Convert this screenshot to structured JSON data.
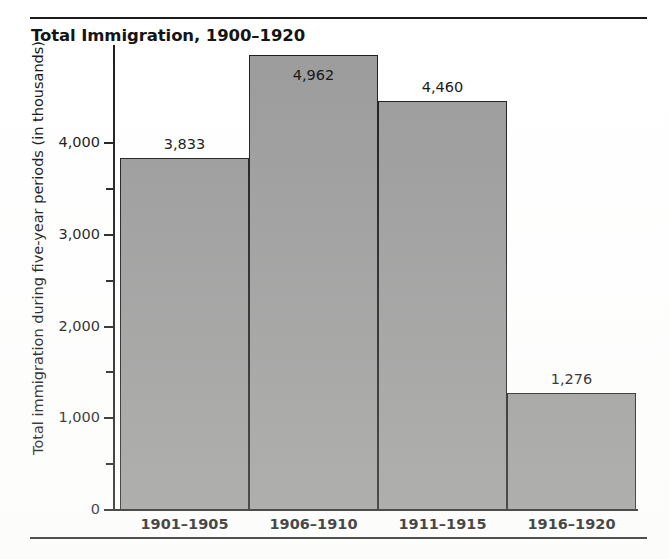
{
  "figure": {
    "title": "Total Immigration, 1900–1920",
    "top_rule": true,
    "bottom_rule": true
  },
  "chart_data": {
    "type": "bar",
    "title": "Total Immigration, 1900–1920",
    "xlabel": "",
    "ylabel": "Total immigration during five-year periods (in thousands)",
    "categories": [
      "1901–1905",
      "1906–1910",
      "1911–1915",
      "1916–1920"
    ],
    "values": [
      3833,
      4962,
      4460,
      1276
    ],
    "value_labels": [
      "3,833",
      "4,962",
      "4,460",
      "1,276"
    ],
    "ylim": [
      0,
      5150
    ],
    "ytick_values": [
      0,
      500,
      1000,
      1500,
      2000,
      2500,
      3000,
      3500,
      4000
    ],
    "ytick_labels": [
      "0",
      "",
      "1,000",
      "",
      "2,000",
      "",
      "3,000",
      "",
      "4,000"
    ],
    "major_ytick_labels": [
      "0",
      "1,000",
      "2,000",
      "3,000",
      "4,000"
    ],
    "grid": false,
    "legend": null,
    "bar_color": "#9a9a9a",
    "bar_edge_color": "#1a1a1a",
    "axis_color": "#1a1a1a",
    "background_color": "#ffffff"
  }
}
